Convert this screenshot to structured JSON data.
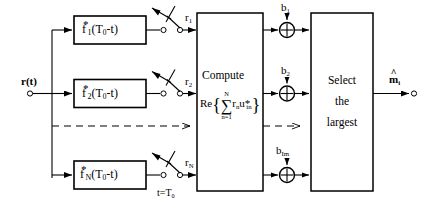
{
  "diagram": {
    "input": {
      "label": "r(t)",
      "name": "input-signal"
    },
    "filters": [
      {
        "base": "f",
        "star": "*",
        "sub": "1",
        "arg": "(T",
        "argsub": "0",
        "argrest": "-t)",
        "full": "f*1(T0-t)"
      },
      {
        "base": "f",
        "star": "*",
        "sub": "2",
        "arg": "(T",
        "argsub": "0",
        "argrest": "-t)",
        "full": "f*2(T0-t)"
      },
      {
        "base": "f",
        "star": "*",
        "sub": "N",
        "arg": "(T",
        "argsub": "0",
        "argrest": "-t)",
        "full": "f*N(T0-t)"
      }
    ],
    "sampler_label": "t=T",
    "sampler_sub": "0",
    "sample_outputs": [
      {
        "base": "r",
        "sub": "1"
      },
      {
        "base": "r",
        "sub": "2"
      },
      {
        "base": "r",
        "sub": "N"
      }
    ],
    "compute_block": {
      "title": "Compute",
      "formula_re": "Re",
      "formula_open": "{",
      "formula_close": "}",
      "sum_upper": "N",
      "sum_lower": "n=1",
      "sum_symbol": "∑",
      "term_r": "r",
      "term_r_sub": "n",
      "term_u": "u",
      "term_u_star": "*",
      "term_u_sub": "in",
      "formula_plain": "Re{ sum n=1..N rn u*in }"
    },
    "bias_inputs": [
      {
        "base": "b",
        "sub": "1"
      },
      {
        "base": "b",
        "sub": "2"
      },
      {
        "base": "b",
        "sub": "Im"
      }
    ],
    "adder_symbol": "⊕",
    "select_block": {
      "line1": "Select",
      "line2": "the",
      "line3": "largest"
    },
    "output": {
      "base": "m",
      "sub": "i",
      "hat": "^",
      "label": "m̂i"
    },
    "colors": {
      "stroke": "#000000",
      "background": "#ffffff",
      "dashed": "#000000"
    }
  }
}
